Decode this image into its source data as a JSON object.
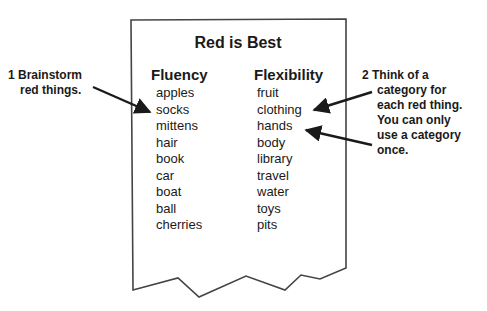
{
  "title": "Red is Best",
  "columns": {
    "fluency": {
      "heading": "Fluency",
      "items": [
        "apples",
        "socks",
        "mittens",
        "hair",
        "book",
        "car",
        "boat",
        "ball",
        "cherries"
      ]
    },
    "flexibility": {
      "heading": "Flexibility",
      "items": [
        "fruit",
        "clothing",
        "hands",
        "body",
        "library",
        "travel",
        "water",
        "toys",
        "pits"
      ]
    }
  },
  "notes": {
    "left": {
      "line1": "1 Brainstorm",
      "line2": "red things."
    },
    "right": {
      "line1": "2 Think of a",
      "line2": "category for",
      "line3": "each red thing.",
      "line4": "You can only",
      "line5": "use a category",
      "line6": "once."
    }
  },
  "colors": {
    "ink": "#1a1a1a",
    "paper_border": "#444444",
    "background": "#ffffff"
  }
}
